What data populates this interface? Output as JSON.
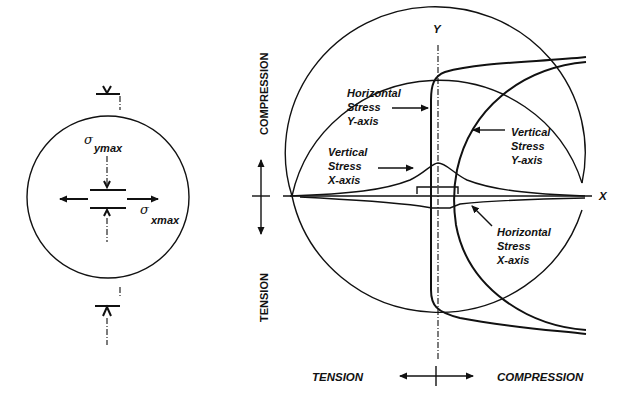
{
  "left_figure": {
    "sigma_y_symbol": "σ",
    "sigma_y_subscript": "ymax",
    "sigma_x_symbol": "σ",
    "sigma_x_subscript": "xmax"
  },
  "right_figure": {
    "y_axis_label": "Y",
    "x_axis_label": "X",
    "vertical_scale": {
      "top_label": "COMPRESSION",
      "bottom_label": "TENSION"
    },
    "horizontal_scale": {
      "left_label": "TENSION",
      "right_label": "COMPRESSION"
    },
    "curves": [
      {
        "id": "horizontal-stress-y-axis",
        "lines": [
          "Horizontal",
          "Stress",
          "Y-axis"
        ]
      },
      {
        "id": "vertical-stress-y-axis",
        "lines": [
          "Vertical",
          "Stress",
          "Y-axis"
        ]
      },
      {
        "id": "vertical-stress-x-axis",
        "lines": [
          "Vertical",
          "Stress",
          "X-axis"
        ]
      },
      {
        "id": "horizontal-stress-x-axis",
        "lines": [
          "Horizontal",
          "Stress",
          "X-axis"
        ]
      }
    ]
  },
  "colors": {
    "ink": "#111111",
    "background": "#ffffff"
  }
}
